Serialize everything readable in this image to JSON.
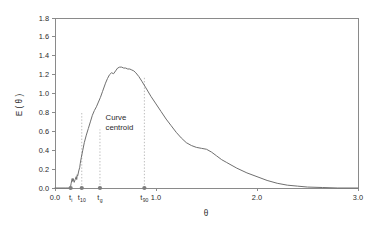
{
  "chart_data": {
    "type": "line",
    "title": "",
    "subtitle": "",
    "xlabel": "θ",
    "ylabel": "E ( θ )",
    "xlim": [
      0.0,
      3.0
    ],
    "ylim": [
      0.0,
      1.8
    ],
    "grid": false,
    "legend": null,
    "x_ticks": [
      {
        "value": 0.0,
        "label": "0.0"
      },
      {
        "value": 1.0,
        "label": "1.0"
      },
      {
        "value": 2.0,
        "label": "2.0"
      },
      {
        "value": 3.0,
        "label": "3.0"
      }
    ],
    "y_ticks": [
      {
        "value": 0.0,
        "label": "0.0"
      },
      {
        "value": 0.2,
        "label": "0.2"
      },
      {
        "value": 0.4,
        "label": "0.4"
      },
      {
        "value": 0.6,
        "label": "0.6"
      },
      {
        "value": 0.8,
        "label": "0.8"
      },
      {
        "value": 1.0,
        "label": "1.0"
      },
      {
        "value": 1.2,
        "label": "1.2"
      },
      {
        "value": 1.4,
        "label": "1.4"
      },
      {
        "value": 1.6,
        "label": "1.6"
      },
      {
        "value": 1.8,
        "label": "1.8"
      }
    ],
    "series": [
      {
        "name": "E(θ)",
        "color": "#6f6f6f",
        "x": [
          0.0,
          0.05,
          0.1,
          0.14,
          0.155,
          0.16,
          0.17,
          0.175,
          0.18,
          0.19,
          0.2,
          0.21,
          0.215,
          0.22,
          0.225,
          0.235,
          0.245,
          0.25,
          0.26,
          0.275,
          0.29,
          0.31,
          0.33,
          0.35,
          0.37,
          0.39,
          0.41,
          0.43,
          0.45,
          0.47,
          0.49,
          0.5,
          0.52,
          0.54,
          0.56,
          0.58,
          0.6,
          0.62,
          0.64,
          0.66,
          0.68,
          0.7,
          0.72,
          0.74,
          0.76,
          0.78,
          0.8,
          0.83,
          0.86,
          0.9,
          0.95,
          1.0,
          1.05,
          1.1,
          1.15,
          1.2,
          1.25,
          1.3,
          1.35,
          1.4,
          1.45,
          1.5,
          1.55,
          1.6,
          1.65,
          1.7,
          1.8,
          1.9,
          2.0,
          2.1,
          2.2,
          2.3,
          2.4,
          2.5,
          2.65,
          2.8,
          3.0
        ],
        "y": [
          0.0,
          0.0,
          0.0,
          0.0,
          0.02,
          0.05,
          0.1,
          0.07,
          0.1,
          0.06,
          0.09,
          0.12,
          0.09,
          0.14,
          0.13,
          0.18,
          0.22,
          0.26,
          0.32,
          0.4,
          0.48,
          0.56,
          0.63,
          0.7,
          0.77,
          0.82,
          0.86,
          0.91,
          0.96,
          1.02,
          1.08,
          1.11,
          1.16,
          1.2,
          1.22,
          1.21,
          1.24,
          1.27,
          1.28,
          1.28,
          1.27,
          1.27,
          1.26,
          1.26,
          1.25,
          1.24,
          1.22,
          1.18,
          1.13,
          1.06,
          0.97,
          0.89,
          0.81,
          0.73,
          0.66,
          0.59,
          0.53,
          0.48,
          0.45,
          0.43,
          0.42,
          0.41,
          0.38,
          0.34,
          0.3,
          0.27,
          0.21,
          0.16,
          0.12,
          0.08,
          0.05,
          0.03,
          0.02,
          0.01,
          0.005,
          0.0,
          0.0
        ]
      }
    ],
    "markers": [
      {
        "id": "ti",
        "x": 0.155,
        "y": 0.0,
        "label": "t",
        "sublabel": "i",
        "guide": false,
        "guide_top": 0.0
      },
      {
        "id": "t10",
        "x": 0.265,
        "y": 0.0,
        "label": "t",
        "sublabel": "10",
        "guide": true,
        "guide_top": 0.8
      },
      {
        "id": "tg",
        "x": 0.445,
        "y": 0.0,
        "label": "t",
        "sublabel": "g",
        "guide": true,
        "guide_top": 0.62
      },
      {
        "id": "t90",
        "x": 0.885,
        "y": 0.0,
        "label": "t",
        "sublabel": "90",
        "guide": true,
        "guide_top": 1.18
      }
    ],
    "annotations": [
      {
        "id": "centroid-note",
        "line1": "Curve",
        "line2": "centroid",
        "x": 0.5,
        "y": 0.72
      }
    ],
    "colors": {
      "curve": "#6f6f6f",
      "axis": "#8a8a8a",
      "guide": "#b6b6b6",
      "marker": "#7d7d7d",
      "text": "#2b2b2b",
      "background": "#ffffff"
    }
  }
}
